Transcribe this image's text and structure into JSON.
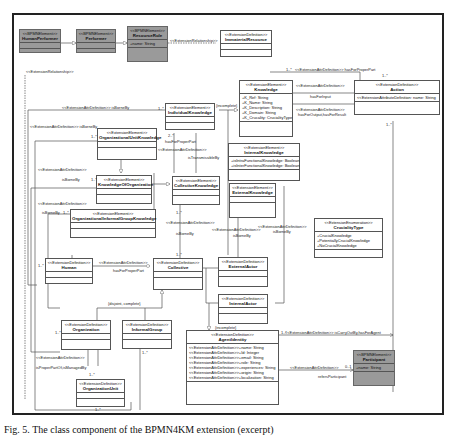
{
  "diagram": {
    "classes": {
      "human_performer": {
        "stereotype": "<<BPMNElement>>",
        "name": "HumanPerformer",
        "attributes": []
      },
      "performer": {
        "stereotype": "<<BPMNElement>>",
        "name": "Performer",
        "attributes": []
      },
      "resource_role": {
        "stereotype": "<<BPMNElement>>",
        "name": "ResourceRole",
        "attributes": [
          "+name: String"
        ]
      },
      "immaterial_resource": {
        "stereotype": "<<ExtensionDefinition>>",
        "name": "ImmaterialResource",
        "attributes": []
      },
      "knowledge": {
        "stereotype": "<<ExtensionElement>>",
        "name": "Knowledge",
        "attributes": [
          "+K_Ref: String",
          "+K_Name: String",
          "+K_Description: String",
          "+K_Domain: String",
          "+K_Crucality: CrucialityType"
        ]
      },
      "action": {
        "stereotype": "<<ExtensionDefinition>>",
        "name": "Action",
        "attributes": [
          "<<ExtensionAttributeDefinition: name: String"
        ]
      },
      "individual_knowledge": {
        "stereotype": "<<ExtensionElement>>",
        "name": "IndividualKnowledge",
        "attributes": []
      },
      "organizational_unit_knowledge": {
        "stereotype": "<<ExtensionElement>>",
        "name": "OrganizationalUnitKnowledge",
        "attributes": []
      },
      "internal_knowledge": {
        "stereotype": "<<ExtensionElement>>",
        "name": "InternalKnowledge",
        "attributes": [
          "+isIntraFunctionalKnowledge: Boolean",
          "+isInterFunctionalKnowledge: Boolean"
        ]
      },
      "knowledge_of_organization": {
        "stereotype": "<<ExtensionElement>>",
        "name": "KnowledgeOfOrganization",
        "attributes": []
      },
      "collective_knowledge": {
        "stereotype": "<<ExtensionElement>>",
        "name": "CollectiveKnowledge",
        "attributes": []
      },
      "external_knowledge": {
        "stereotype": "<<ExtensionElement>>",
        "name": "ExternalKnowledge",
        "attributes": []
      },
      "org_informal_group_knowledge": {
        "stereotype": "<<ExtensionElement>>",
        "name": "OrganizationalInformalGroupKnowledge",
        "attributes": []
      },
      "cruciality_type": {
        "stereotype": "<<ExtensionEnumeration>>",
        "name": "CrucialityType",
        "attributes": [
          "+CrucialKnowledge",
          "+PotentiallyCrucialKnowledge",
          "+NoCrucialKnowledge"
        ]
      },
      "human": {
        "stereotype": "<<ExtensionDefinition>>",
        "name": "Human",
        "attributes": []
      },
      "collective": {
        "stereotype": "<<ExtensionDefinition>>",
        "name": "Collective",
        "attributes": []
      },
      "external_actor": {
        "stereotype": "<<ExtensionDefinition>>",
        "name": "ExternalActor",
        "attributes": []
      },
      "internal_actor": {
        "stereotype": "<<ExtensionDefinition>>",
        "name": "InternalActor",
        "attributes": []
      },
      "organization": {
        "stereotype": "<<ExtensionDefinition>>",
        "name": "Organization",
        "attributes": []
      },
      "informal_group": {
        "stereotype": "<<ExtensionDefinition>>",
        "name": "InformalGroup",
        "attributes": []
      },
      "organization_unit": {
        "stereotype": "<<ExtensionDefinition>>",
        "name": "OrganizationUnit",
        "attributes": []
      },
      "agent_identity": {
        "stereotype": "<<ExtensionDefinition>>",
        "name": "AgentIdentity",
        "attributes": [
          "<<ExtensionAttrDefinition>>+name: String",
          "<<ExtensionAttrDefinition>>+Id: Integer",
          "<<ExtensionAttrDefinition>>+email: String",
          "<<ExtensionAttrDefinition>>+role: String",
          "<<ExtensionAttrDefinition>>+experiences: String",
          "<<ExtensionAttrDefinition>>+origin: String",
          "<<ExtensionAttrDefinition>>+localization: String"
        ]
      },
      "participant": {
        "stereotype": "<<BPMNElement>>",
        "name": "Participant",
        "attributes": [
          "+name: String"
        ]
      }
    },
    "labels": {
      "ext_rel_1": "<<ExtensionRelationship>>",
      "ext_rel_2": "<<ExtensionRelationship>>",
      "has_for_proper_part_top": "<<ExtensionAttrDefinition>> hasForProperPart",
      "has_for_input_st": "<<ExtensionAttrDefinition>>",
      "has_for_input": "hasForInput",
      "has_for_output_st": "<<ExtensionAttrDefinition>>",
      "has_for_output": "hasForOutput,hasForResult",
      "is_borne_by_1": "<<ExtensionAttrDefinition>> isBorneBy",
      "is_borne_by_2": "<<ExtensionAttrDefinition>> isBorneBy",
      "is_borne_by_3_st": "<<ExtensionAttrDefinition>>",
      "is_borne_by_3": "isBorneBy",
      "is_borne_by_4_st": "<<ExtensionAttrDefinition>>",
      "is_borne_by_4": "isBorneBy",
      "is_borne_by_5_st": "<<ExtensionAttrDefinition>>",
      "is_borne_by_5": "isBorneBy",
      "is_borne_by_6_st": "<<ExtensionAttrDefinition>>",
      "is_borne_by_6": "isBorneBy",
      "is_borne_by_7_st": "<<ExtensionAttrDefinition>>",
      "is_borne_by_7": "isBorneBy",
      "has_for_proper_part_ik": "hasForProperPart",
      "is_transmissible_st": "<<ExtensionAttrDefinition>>",
      "is_transmissible": "isTransmissibleBy",
      "human_collective_st": "<<ExtensionAttrDefinition>>",
      "human_collective": "hasForProperPart",
      "incomplete_1": "{incomplete}",
      "incomplete_2": "{incomplete}",
      "disjoint_complete": "{disjoint, complete}",
      "is_proper_part_st": "<<ExtensionAttrDefinition>>",
      "is_proper_part": "isProperPartOf,isManagedBy",
      "carry_out_st": "<<ExtensionAttrDefinition>> isCarryOutBy,hasForAgent",
      "refers_participant_st": "<<ExtensionAttrDefinition>>",
      "refers_participant": "refersParticipant",
      "mult_1n": "1..*",
      "mult_star": "*",
      "mult_2n": "2..*",
      "mult_0n": "0..1",
      "mult_01": "0..1"
    },
    "caption": "Fig. 5. The class component of the BPMN4KM extension (excerpt)"
  }
}
